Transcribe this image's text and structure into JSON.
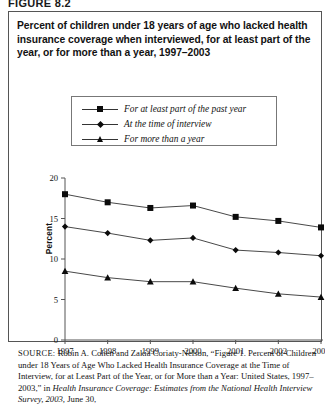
{
  "figure": {
    "label": "FIGURE 8.2",
    "title": "Percent of children under 18 years of age who lacked health insurance coverage when interviewed, for at least part of the year, or for more than a year, 1997–2003"
  },
  "source": {
    "prefix": "SOURCE:",
    "text_part1": "Robin A. Cohen and Zakia Coriaty-Nelson, “Figure 1. Percent of Children under 18 Years of Age Who Lacked Health Insurance Coverage at the Time of Interview, for at Least Part of the Year, or for More than a Year: United States, 1997–2003,” in ",
    "italic1": "Health Insurance Coverage: Estimates from the National Health Interview Survey, 2003,",
    "text_part2": " June 30,"
  },
  "legend": {
    "items": [
      {
        "label": "For at least part of the past year",
        "marker": "square-marker"
      },
      {
        "label": "At the time of interview",
        "marker": "diamond-marker"
      },
      {
        "label": "For more than a year",
        "marker": "triangle-marker"
      }
    ]
  },
  "colors": {
    "line": "#333333",
    "marker": "#0b0b0b",
    "axis": "#555555",
    "border": "#555555",
    "background": "#ffffff"
  },
  "chart_data": {
    "type": "line",
    "title": "Percent of children under 18 years of age who lacked health insurance coverage when interviewed, for at least part of the year, or for more than a year, 1997–2003",
    "xlabel": "",
    "ylabel": "Percent",
    "x": [
      "1997",
      "1998",
      "1999",
      "2000",
      "2001",
      "2002",
      "2003"
    ],
    "categories": [
      "1997",
      "1998",
      "1999",
      "2000",
      "2001",
      "2002",
      "2003"
    ],
    "ylim": [
      0,
      20
    ],
    "yticks": [
      0,
      5,
      10,
      15,
      20
    ],
    "ytick_labels": [
      "0",
      "5",
      "10",
      "15",
      "20"
    ],
    "grid": false,
    "legend_position": "above-plot-center",
    "series": [
      {
        "name": "For at least part of the past year",
        "marker": "square",
        "values": [
          18.0,
          17.0,
          16.3,
          16.6,
          15.2,
          14.7,
          13.9
        ]
      },
      {
        "name": "At the time of interview",
        "marker": "diamond",
        "values": [
          14.0,
          13.2,
          12.3,
          12.6,
          11.1,
          10.8,
          10.4
        ]
      },
      {
        "name": "For more than a year",
        "marker": "triangle",
        "values": [
          8.5,
          7.7,
          7.2,
          7.2,
          6.4,
          5.7,
          5.3
        ]
      }
    ]
  }
}
